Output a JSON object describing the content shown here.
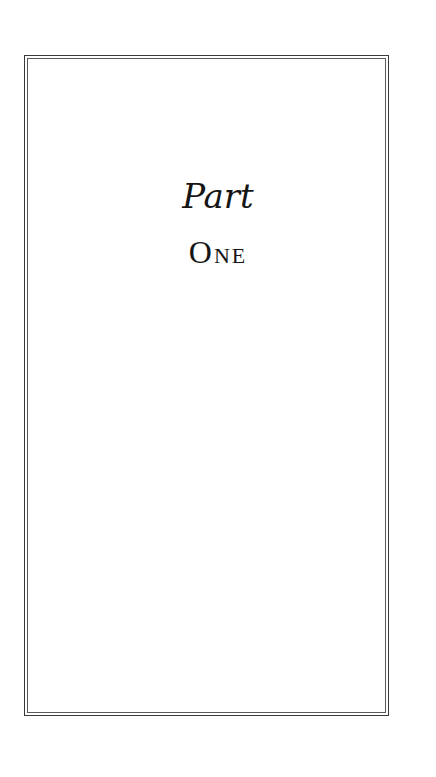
{
  "page": {
    "part_label": "Part",
    "part_number": "One",
    "colors": {
      "background": "#ffffff",
      "text": "#151515",
      "border": "#3a3a3a"
    }
  }
}
